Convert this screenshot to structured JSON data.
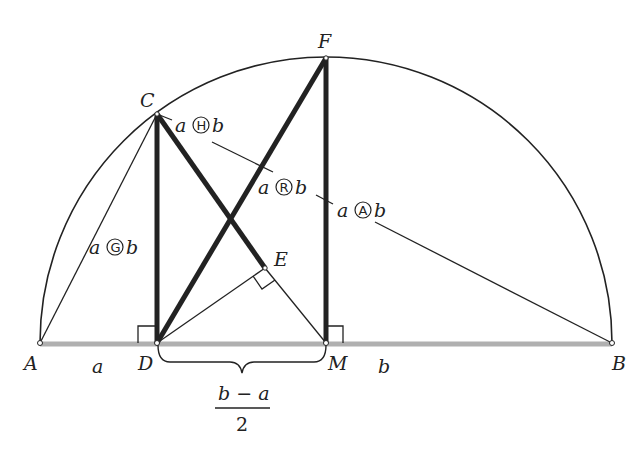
{
  "diagram": {
    "points": {
      "A": {
        "label": "A",
        "x": 40,
        "y": 343
      },
      "D": {
        "label": "D",
        "x": 157,
        "y": 343
      },
      "M": {
        "label": "M",
        "x": 326,
        "y": 343
      },
      "B": {
        "label": "B",
        "x": 612,
        "y": 343
      },
      "C": {
        "label": "C",
        "x": 157,
        "y": 114
      },
      "F": {
        "label": "F",
        "x": 326,
        "y": 58
      },
      "E": {
        "label": "E",
        "x": 265,
        "y": 268
      }
    },
    "segment_labels": {
      "a": "a",
      "b": "b",
      "fraction_numerator": "b − a",
      "fraction_denominator": "2"
    },
    "means": [
      {
        "name": "harmonic",
        "left": "a",
        "symbol": "H",
        "right": "b"
      },
      {
        "name": "geometric",
        "left": "a",
        "symbol": "G",
        "right": "b"
      },
      {
        "name": "root-mean-square",
        "left": "a",
        "symbol": "R",
        "right": "b"
      },
      {
        "name": "arithmetic",
        "left": "a",
        "symbol": "A",
        "right": "b"
      }
    ],
    "colors": {
      "line": "#222222",
      "diameter": "#b0b0b0",
      "background": "#ffffff"
    }
  }
}
